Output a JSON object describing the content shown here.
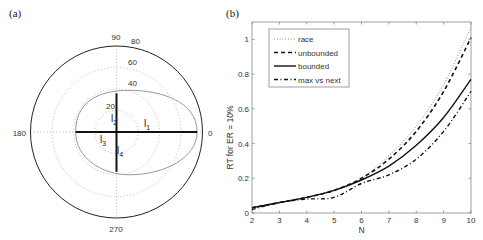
{
  "panels": {
    "a": {
      "label": "(a)"
    },
    "b": {
      "label": "(b)"
    }
  },
  "chart_data": [
    {
      "type": "polar",
      "panel": "(a)",
      "title": "",
      "angle_ticks": [
        "0",
        "90",
        "180",
        "270"
      ],
      "radial_ticks": [
        "20",
        "40",
        "60",
        "80"
      ],
      "radial_max": 80,
      "grid": true,
      "segments": [
        {
          "name": "l1",
          "angle": 0,
          "length": 75
        },
        {
          "name": "l2",
          "angle": 90,
          "length": 36
        },
        {
          "name": "l3",
          "angle": 180,
          "length": 38
        },
        {
          "name": "l4",
          "angle": 270,
          "length": 37
        }
      ],
      "segment_labels": {
        "l1": "l",
        "l1_sub": "1",
        "l2": "l",
        "l2_sub": "2",
        "l3": "l",
        "l3_sub": "3",
        "l4": "l",
        "l4_sub": "4"
      },
      "envelope": "gray closed curve through segment endpoints (elongated to the right)"
    },
    {
      "type": "line",
      "panel": "(b)",
      "title": "",
      "xlabel": "N",
      "ylabel": "RT for ER = 10%",
      "xlim": [
        2,
        10
      ],
      "ylim": [
        0,
        1.1
      ],
      "x_ticks": [
        "2",
        "3",
        "4",
        "5",
        "6",
        "7",
        "8",
        "9",
        "10"
      ],
      "y_ticks": [
        "0",
        "0.2",
        "0.4",
        "0.6",
        "0.8",
        "1"
      ],
      "legend_position": "upper left",
      "grid": false,
      "x": [
        2,
        3,
        4,
        5,
        6,
        7,
        8,
        9,
        10
      ],
      "series": [
        {
          "name": "race",
          "style": "dotted",
          "values": [
            0.03,
            0.06,
            0.09,
            0.13,
            0.2,
            0.33,
            0.5,
            0.74,
            1.07
          ]
        },
        {
          "name": "unbounded",
          "style": "dashed",
          "values": [
            0.03,
            0.06,
            0.09,
            0.13,
            0.2,
            0.31,
            0.47,
            0.7,
            1.01
          ]
        },
        {
          "name": "bounded",
          "style": "solid",
          "values": [
            0.03,
            0.06,
            0.09,
            0.13,
            0.19,
            0.27,
            0.39,
            0.55,
            0.77
          ]
        },
        {
          "name": "max vs next",
          "style": "dash-dot",
          "values": [
            0.02,
            0.06,
            0.08,
            0.09,
            0.17,
            0.22,
            0.31,
            0.47,
            0.7
          ]
        }
      ]
    }
  ]
}
